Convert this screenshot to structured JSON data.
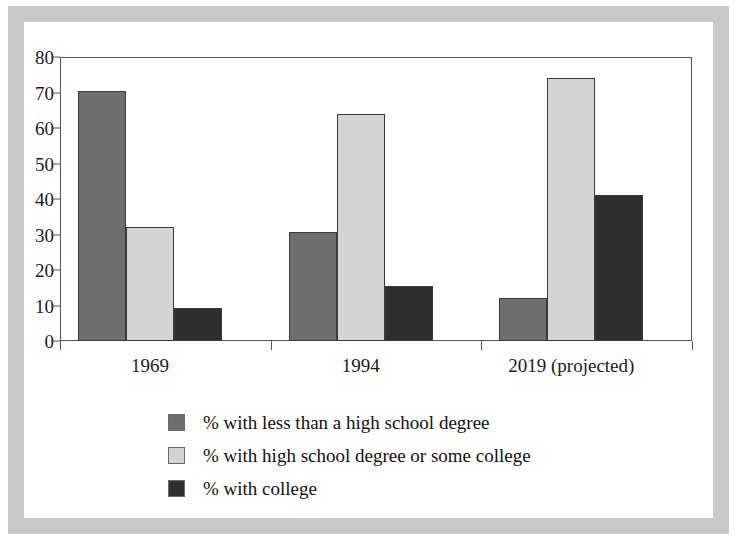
{
  "figure": {
    "background": "#ffffff",
    "frame_color": "#c9c9c9"
  },
  "chart_data": {
    "type": "bar",
    "title": "",
    "subtitle": "",
    "xlabel": "",
    "ylabel": "",
    "categories": [
      "1969",
      "1994",
      "2019 (projected)"
    ],
    "series": [
      {
        "name": "% with less than a high school degree",
        "color": "#6e6e6e",
        "values": [
          70.3,
          30.6,
          12.2
        ]
      },
      {
        "name": "% with high school degree or some college",
        "color": "#d4d4d4",
        "values": [
          32.0,
          64.0,
          74.0
        ]
      },
      {
        "name": "% with college",
        "color": "#2e2e2e",
        "values": [
          9.3,
          15.6,
          41.0
        ]
      }
    ],
    "ylim": [
      0,
      80
    ],
    "yticks": [
      0,
      10,
      20,
      30,
      40,
      50,
      60,
      70,
      80
    ],
    "ytick_labels": [
      "0",
      "10",
      "20",
      "30",
      "40",
      "50",
      "60",
      "70",
      "80"
    ],
    "grid": false,
    "legend_position": "below-left",
    "axis_color": "#555555",
    "bar_edge_color": "#3a3a3a"
  },
  "legend": {
    "entries": [
      {
        "label": "% with less than a high school degree",
        "color": "#6e6e6e"
      },
      {
        "label": "% with high school degree or some college",
        "color": "#d4d4d4"
      },
      {
        "label": "% with college",
        "color": "#2e2e2e"
      }
    ]
  }
}
